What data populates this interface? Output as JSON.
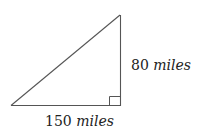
{
  "diagram": {
    "type": "right-triangle",
    "colors": {
      "stroke": "#555555",
      "text": "#222222",
      "background": "#ffffff"
    },
    "sides": {
      "vertical": {
        "value": "80",
        "unit": "miles"
      },
      "horizontal": {
        "value": "150",
        "unit": "miles"
      },
      "hypotenuse": {
        "value": "",
        "unit": ""
      }
    },
    "right_angle_marker": true
  }
}
